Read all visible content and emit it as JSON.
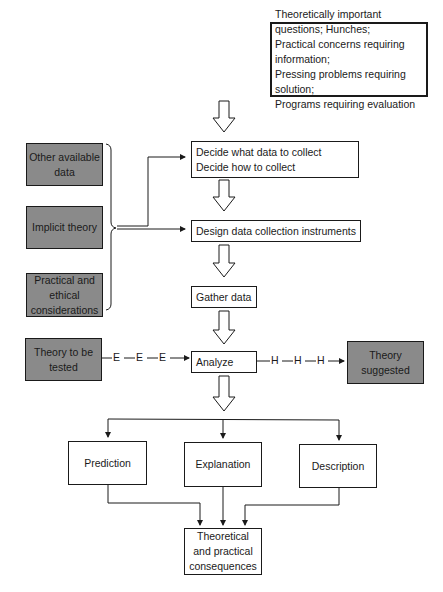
{
  "diagram": {
    "top_box": {
      "lines": [
        "Theoretically important questions; Hunches;",
        "Practical concerns requiring information;",
        "Pressing problems requiring solution;",
        "Programs requiring evaluation"
      ]
    },
    "steps": {
      "decide": {
        "lines": [
          "Decide what data to collect",
          "Decide how to collect"
        ]
      },
      "design": {
        "label": "Design data collection instruments"
      },
      "gather": {
        "label": "Gather data"
      },
      "analyze": {
        "label": "Analyze"
      }
    },
    "inputs": {
      "other_data": {
        "lines": [
          "Other available",
          "data"
        ]
      },
      "implicit_theory": {
        "lines": [
          "Implicit theory"
        ]
      },
      "practical_ethical": {
        "lines": [
          "Practical and",
          "ethical",
          "considerations"
        ]
      }
    },
    "theory_tested": {
      "lines": [
        "Theory to be",
        "tested"
      ]
    },
    "theory_suggested": {
      "lines": [
        "Theory",
        "suggested"
      ]
    },
    "e_path": {
      "labels": [
        "E",
        "E",
        "E"
      ]
    },
    "h_path": {
      "labels": [
        "H",
        "H",
        "H"
      ]
    },
    "outcomes": {
      "prediction": {
        "label": "Prediction"
      },
      "explanation": {
        "label": "Explanation"
      },
      "description": {
        "label": "Description"
      }
    },
    "consequences": {
      "lines": [
        "Theoretical",
        "and practical",
        "consequences"
      ]
    },
    "colors": {
      "shaded_fill": "#8a8a8a",
      "line": "#1a1a1a",
      "background": "#ffffff"
    }
  }
}
